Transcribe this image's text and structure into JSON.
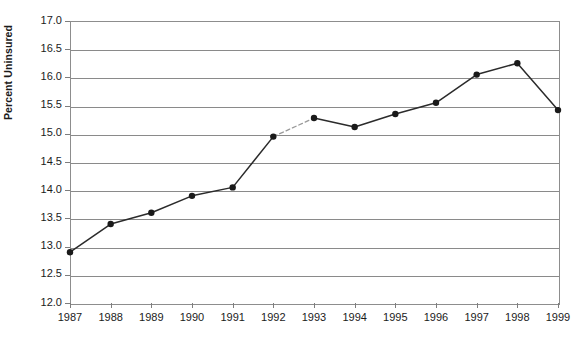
{
  "chart_data": {
    "type": "line",
    "title": "",
    "xlabel": "",
    "ylabel": "Percent Uninsured",
    "categories": [
      "1987",
      "1988",
      "1989",
      "1990",
      "1991",
      "1992",
      "1993",
      "1994",
      "1995",
      "1996",
      "1997",
      "1998",
      "1999"
    ],
    "values": [
      12.9,
      13.4,
      13.6,
      13.9,
      14.05,
      14.95,
      15.28,
      15.12,
      15.35,
      15.55,
      16.05,
      16.25,
      15.42
    ],
    "x": [
      1987,
      1988,
      1989,
      1990,
      1991,
      1992,
      1993,
      1994,
      1995,
      1996,
      1997,
      1998,
      1999
    ],
    "ylim": [
      12.0,
      17.0
    ],
    "xlim": [
      1987,
      1999
    ],
    "ytick_labels": [
      "17.0",
      "16.5",
      "16.0",
      "15.5",
      "15.0",
      "14.5",
      "14.0",
      "13.5",
      "13.0",
      "12.5",
      "12.0"
    ],
    "ytick_values": [
      17.0,
      16.5,
      16.0,
      15.5,
      15.0,
      14.5,
      14.0,
      13.5,
      13.0,
      12.5,
      12.0
    ],
    "ytick_step": 0.5,
    "grid": true,
    "grid_axis": "y",
    "legend": "none",
    "marker": "filled-circle",
    "line_color": "#2b2b2b",
    "marker_color": "#1a1a1a",
    "grid_color": "#8a8a8a",
    "frame_color": "#8d8d8d",
    "background": "#ffffff",
    "series_break": {
      "between": [
        "1992",
        "1993"
      ],
      "style": "dashed-light",
      "note": "line segment between 1992 and 1993 is drawn faint/dashed indicating a break in comparability"
    },
    "annotations": []
  }
}
